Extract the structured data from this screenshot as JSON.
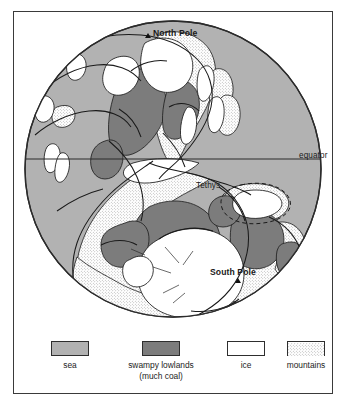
{
  "figure": {
    "kind": "paleogeographic-globe-map",
    "background_color": "#ffffff",
    "frame_color": "#3a3a3a"
  },
  "map": {
    "labels": {
      "north_pole": "North Pole",
      "south_pole": "South Pole",
      "tethys": "Tethys",
      "equator": "equator"
    },
    "markers": {
      "north_pole_marker": "triangle",
      "south_pole_marker": "triangle"
    },
    "colors": {
      "sea": "#b2b2b2",
      "swampy_lowlands": "#7c7c7c",
      "ice": "#ffffff",
      "mountains": "#ffffff",
      "outline": "#1a1a1a",
      "globe_edge": "#2b2b2b"
    }
  },
  "legend": {
    "items": [
      {
        "label": "sea",
        "label2": "",
        "fill": "#b2b2b2",
        "pattern": "solid",
        "icon": "legend-swatch-sea"
      },
      {
        "label": "swampy lowlands",
        "label2": "(much coal)",
        "fill": "#7c7c7c",
        "pattern": "solid",
        "icon": "legend-swatch-swamp"
      },
      {
        "label": "ice",
        "label2": "",
        "fill": "#ffffff",
        "pattern": "solid",
        "icon": "legend-swatch-ice"
      },
      {
        "label": "mountains",
        "label2": "",
        "fill": "#ffffff",
        "pattern": "stipple",
        "icon": "legend-swatch-mountains"
      }
    ]
  }
}
